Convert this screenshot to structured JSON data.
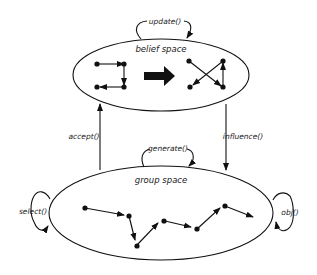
{
  "diagram": {
    "type": "cultural-algorithm",
    "nodes": {
      "belief_space": {
        "label": "belief space",
        "shape": "ellipse"
      },
      "group_space": {
        "label": "group space",
        "shape": "ellipse"
      }
    },
    "edges": {
      "update": {
        "label": "update()",
        "from": "belief_space",
        "to": "belief_space",
        "kind": "self-loop"
      },
      "accept": {
        "label": "accept()",
        "from": "group_space",
        "to": "belief_space"
      },
      "influence": {
        "label": "influence()",
        "from": "belief_space",
        "to": "group_space"
      },
      "generate": {
        "label": "generate()",
        "from": "group_space",
        "to": "group_space",
        "kind": "self-loop"
      },
      "select": {
        "label": "select()",
        "from": "group_space",
        "to": "group_space",
        "kind": "self-loop"
      },
      "obj": {
        "label": "obj()",
        "from": "group_space",
        "to": "group_space",
        "kind": "self-loop"
      }
    },
    "colors": {
      "stroke": "#111111",
      "background": "#ffffff",
      "text": "#222222"
    }
  }
}
